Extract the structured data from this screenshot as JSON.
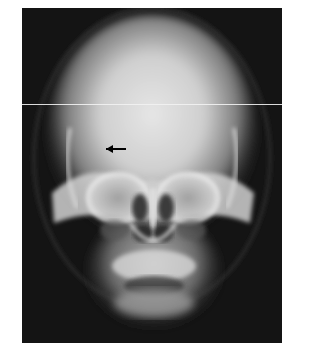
{
  "figure": {
    "annotation": {
      "type": "arrow",
      "direction": "left",
      "color": "#000000"
    },
    "colors": {
      "background": "#ffffff",
      "film_dark": "#141414",
      "bone_bright": "#e8e8e8",
      "artifact_line": "#f2f2f2"
    }
  }
}
